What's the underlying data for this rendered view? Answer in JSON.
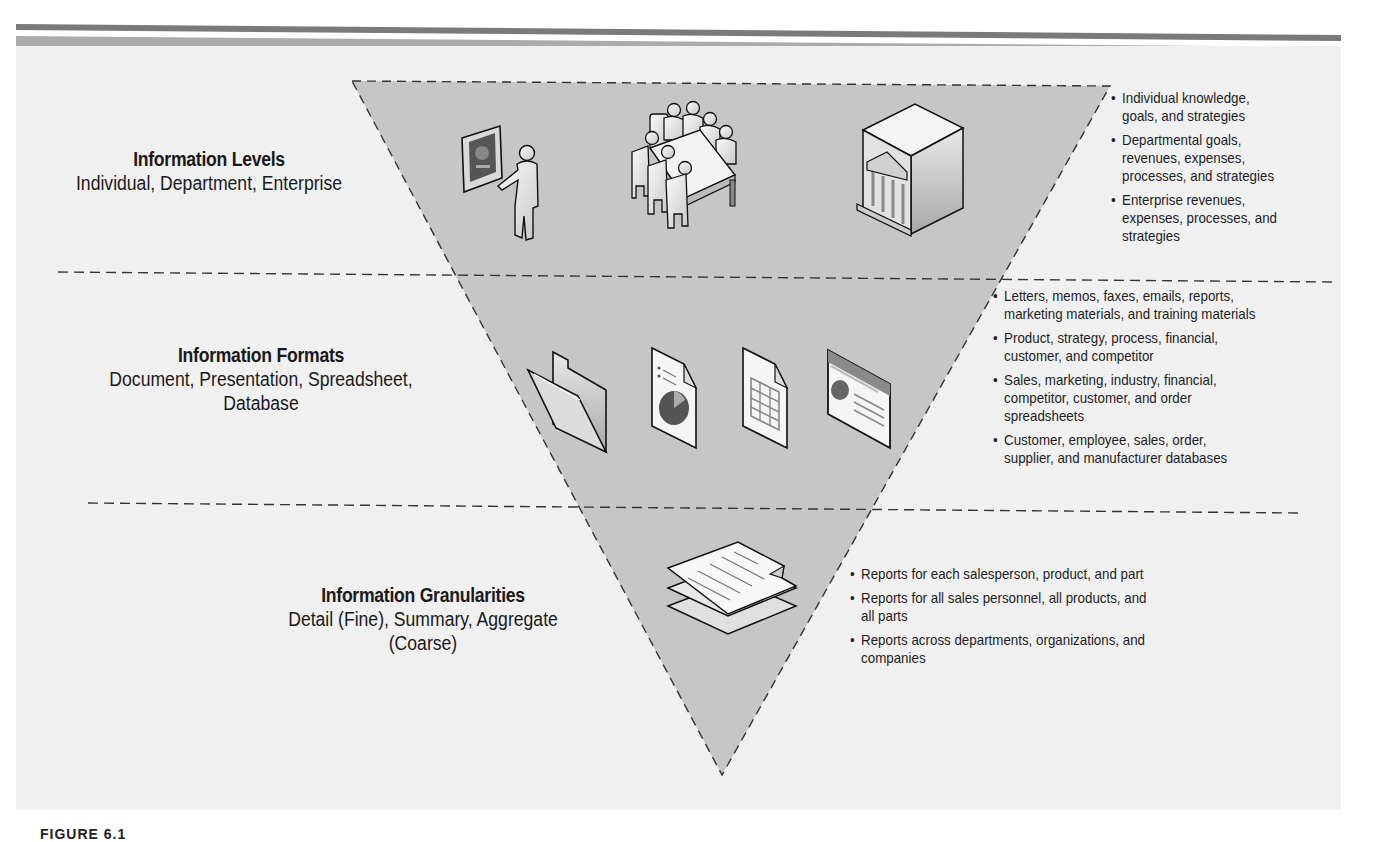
{
  "colors": {
    "page_bg": "#ffffff",
    "panel_bg": "#f0f0f0",
    "triangle_fill": "#c4c4c4",
    "stripe_dark": "#7a7a7a",
    "stripe_light": "#ababab",
    "dash_color": "#333333"
  },
  "sections": [
    {
      "title": "Information Levels",
      "subtitle_lines": [
        "Individual, Department, Enterprise"
      ],
      "icons": [
        "presenter-icon",
        "meeting-table-icon",
        "enterprise-building-icon"
      ],
      "bullets": [
        [
          "Individual knowledge,",
          "goals, and strategies"
        ],
        [
          "Departmental goals,",
          "revenues, expenses,",
          "processes, and strategies"
        ],
        [
          "Enterprise revenues,",
          "expenses, processes, and",
          "strategies"
        ]
      ]
    },
    {
      "title": "Information Formats",
      "subtitle_lines": [
        "Document, Presentation, Spreadsheet,",
        "Database"
      ],
      "icons": [
        "folder-icon",
        "document-chart-icon",
        "spreadsheet-icon",
        "database-screen-icon"
      ],
      "bullets": [
        [
          "Letters, memos, faxes, emails, reports,",
          "marketing materials, and training materials"
        ],
        [
          "Product, strategy, process, financial,",
          "customer, and competitor"
        ],
        [
          "Sales, marketing, industry, financial,",
          "competitor, customer, and order",
          "spreadsheets"
        ],
        [
          "Customer, employee, sales, order,",
          "supplier, and manufacturer databases"
        ]
      ]
    },
    {
      "title": "Information Granularities",
      "subtitle_lines": [
        "Detail (Fine), Summary, Aggregate",
        "(Coarse)"
      ],
      "icons": [
        "stacked-reports-icon"
      ],
      "bullets": [
        [
          "Reports for each salesperson, product, and part"
        ],
        [
          "Reports for all sales personnel, all products, and",
          "all parts"
        ],
        [
          "Reports across departments, organizations, and",
          "companies"
        ]
      ]
    }
  ],
  "figure_label": "FIGURE 6.1"
}
